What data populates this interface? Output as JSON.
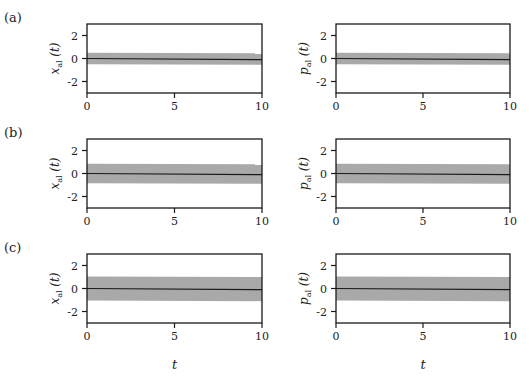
{
  "figure": {
    "panel_labels": [
      "(a)",
      "(b)",
      "(c)"
    ],
    "x_label": "t",
    "colors": {
      "band": "#a9a9a9",
      "line": "#1a1a1a",
      "axes": "#1a1a1a"
    }
  },
  "chart_data": [
    {
      "type": "area",
      "panel": "(a)",
      "position": "left",
      "ylabel": "x_al (t)",
      "xlabel": "",
      "xlim": [
        0,
        10
      ],
      "ylim": [
        -3,
        3
      ],
      "xticks": [
        0,
        5,
        10
      ],
      "yticks": [
        2,
        0,
        -2
      ],
      "grid": false,
      "series": [
        {
          "name": "mean",
          "x": [
            0,
            10
          ],
          "values": [
            0,
            -0.1
          ]
        },
        {
          "name": "band",
          "x": [
            0,
            10
          ],
          "upper": [
            0.5,
            0.45
          ],
          "lower": [
            -0.5,
            -0.55
          ]
        }
      ]
    },
    {
      "type": "area",
      "panel": "(a)",
      "position": "right",
      "ylabel": "p_al (t)",
      "xlabel": "",
      "xlim": [
        0,
        10
      ],
      "ylim": [
        -3,
        3
      ],
      "xticks": [
        0,
        5,
        10
      ],
      "yticks": [
        2,
        0,
        -2
      ],
      "grid": false,
      "series": [
        {
          "name": "mean",
          "x": [
            0,
            10
          ],
          "values": [
            0,
            -0.1
          ]
        },
        {
          "name": "band",
          "x": [
            0,
            10
          ],
          "upper": [
            0.5,
            0.45
          ],
          "lower": [
            -0.5,
            -0.55
          ]
        }
      ]
    },
    {
      "type": "area",
      "panel": "(b)",
      "position": "left",
      "ylabel": "x_al (t)",
      "xlabel": "",
      "xlim": [
        0,
        10
      ],
      "ylim": [
        -3,
        3
      ],
      "xticks": [
        0,
        5,
        10
      ],
      "yticks": [
        2,
        0,
        -2
      ],
      "grid": false,
      "series": [
        {
          "name": "mean",
          "x": [
            0,
            10
          ],
          "values": [
            0,
            -0.1
          ]
        },
        {
          "name": "band",
          "x": [
            0,
            10
          ],
          "upper": [
            0.85,
            0.8
          ],
          "lower": [
            -0.85,
            -0.9
          ]
        }
      ]
    },
    {
      "type": "area",
      "panel": "(b)",
      "position": "right",
      "ylabel": "p_al (t)",
      "xlabel": "",
      "xlim": [
        0,
        10
      ],
      "ylim": [
        -3,
        3
      ],
      "xticks": [
        0,
        5,
        10
      ],
      "yticks": [
        2,
        0,
        -2
      ],
      "grid": false,
      "series": [
        {
          "name": "mean",
          "x": [
            0,
            10
          ],
          "values": [
            0,
            -0.1
          ]
        },
        {
          "name": "band",
          "x": [
            0,
            10
          ],
          "upper": [
            0.85,
            0.8
          ],
          "lower": [
            -0.85,
            -0.9
          ]
        }
      ]
    },
    {
      "type": "area",
      "panel": "(c)",
      "position": "left",
      "ylabel": "x_al (t)",
      "xlabel": "t",
      "xlim": [
        0,
        10
      ],
      "ylim": [
        -3,
        3
      ],
      "xticks": [
        0,
        5,
        10
      ],
      "yticks": [
        2,
        0,
        -2
      ],
      "grid": false,
      "series": [
        {
          "name": "mean",
          "x": [
            0,
            10
          ],
          "values": [
            0,
            -0.1
          ]
        },
        {
          "name": "band",
          "x": [
            0,
            10
          ],
          "upper": [
            1.05,
            1.0
          ],
          "lower": [
            -1.05,
            -1.1
          ]
        }
      ]
    },
    {
      "type": "area",
      "panel": "(c)",
      "position": "right",
      "ylabel": "p_al (t)",
      "xlabel": "t",
      "xlim": [
        0,
        10
      ],
      "ylim": [
        -3,
        3
      ],
      "xticks": [
        0,
        5,
        10
      ],
      "yticks": [
        2,
        0,
        -2
      ],
      "grid": false,
      "series": [
        {
          "name": "mean",
          "x": [
            0,
            10
          ],
          "values": [
            0,
            -0.1
          ]
        },
        {
          "name": "band",
          "x": [
            0,
            10
          ],
          "upper": [
            1.05,
            1.0
          ],
          "lower": [
            -1.05,
            -1.1
          ]
        }
      ]
    }
  ]
}
